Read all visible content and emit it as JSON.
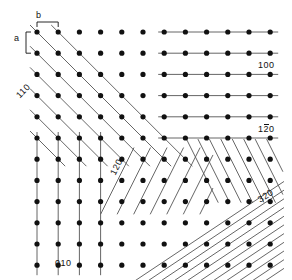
{
  "figure": {
    "type": "crystallographic-lattice-plane-diagram",
    "background_color": "#ffffff",
    "dot_color": "#111111",
    "line_color": "#555555"
  },
  "lattice": {
    "dot_radius_px": 2.6,
    "spacing_x_px": 21.2,
    "spacing_y_px": 21.2,
    "origin_x_px": 37,
    "origin_y_px": 32,
    "cols": 12,
    "rows": 12,
    "axis_label_b": "b",
    "axis_label_a": "a"
  },
  "labels": {
    "b": "b",
    "a": "a",
    "plane_100": "100",
    "plane_010": "010",
    "plane_110": "110",
    "plane_120": "120",
    "plane_1bar20_pre": "1",
    "plane_1bar20_bar": "2",
    "plane_1bar20_post": "0",
    "plane_320": "320"
  },
  "chart_data": {
    "type": "scatter",
    "title": "",
    "xlabel": "b",
    "ylabel": "a",
    "grid": false,
    "legend": "none",
    "point_grid": {
      "cols": 12,
      "rows": 12,
      "spacing_x": 21.2,
      "spacing_y": 21.2
    },
    "plane_families": [
      {
        "indices": "100",
        "direction": "horizontal",
        "slope": 0,
        "label": "100",
        "region": "upper-right"
      },
      {
        "indices": "010",
        "direction": "vertical",
        "slope": null,
        "label": "010",
        "region": "lower-left"
      },
      {
        "indices": "110",
        "direction": "diagonal-up-right",
        "slope": 1,
        "label": "110",
        "region": "upper-left"
      },
      {
        "indices": "120",
        "direction": "diagonal-up-right-steep",
        "slope": 2,
        "label": "120",
        "region": "center"
      },
      {
        "indices": "1-20",
        "direction": "diagonal-down-right-steep",
        "slope": -2,
        "label": "120",
        "region": "right-middle"
      },
      {
        "indices": "320",
        "direction": "diagonal-up-right-shallow",
        "slope": 0.667,
        "label": "320",
        "region": "lower-right"
      }
    ]
  }
}
